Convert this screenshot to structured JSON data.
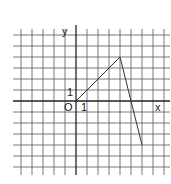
{
  "figure": {
    "type": "coordinate-grid-polyline",
    "labels": {
      "y_axis": "y",
      "x_axis": "x",
      "origin": "O",
      "unit_x": "1",
      "unit_y": "1"
    },
    "grid": {
      "x_min": -5,
      "x_max": 8,
      "y_min": -6,
      "y_max": 6,
      "unit_px": 11,
      "origin_px": [
        76,
        101
      ]
    },
    "polyline_points": [
      [
        0,
        0
      ],
      [
        4,
        4
      ],
      [
        6,
        -4
      ]
    ],
    "colors": {
      "grid": "#555555",
      "axis": "#222222",
      "line": "#333333",
      "background": "#ffffff"
    }
  },
  "chart_data": {
    "type": "line",
    "title": "",
    "xlabel": "x",
    "ylabel": "y",
    "x": [
      0,
      4,
      6
    ],
    "values": [
      0,
      4,
      -4
    ],
    "xlim": [
      -5,
      8
    ],
    "ylim": [
      -6,
      6
    ],
    "grid": true,
    "annotations": [
      "O",
      "1",
      "1"
    ]
  }
}
